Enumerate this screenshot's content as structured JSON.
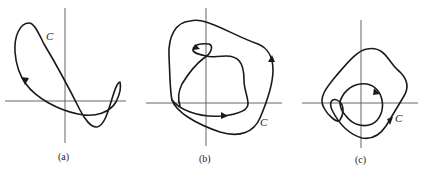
{
  "figure": {
    "panels": [
      {
        "id": "a",
        "caption": "(a)",
        "curve_label": "C",
        "description": "Closed curve crossing itself, with a loop to the right of the vertical axis"
      },
      {
        "id": "b",
        "caption": "(b)",
        "curve_label": "C",
        "description": "Closed curve with an outer loop encircling an inner winding path"
      },
      {
        "id": "c",
        "caption": "(c)",
        "curve_label": "C",
        "description": "Closed curve winding twice around the origin with a small self-loop"
      }
    ]
  }
}
